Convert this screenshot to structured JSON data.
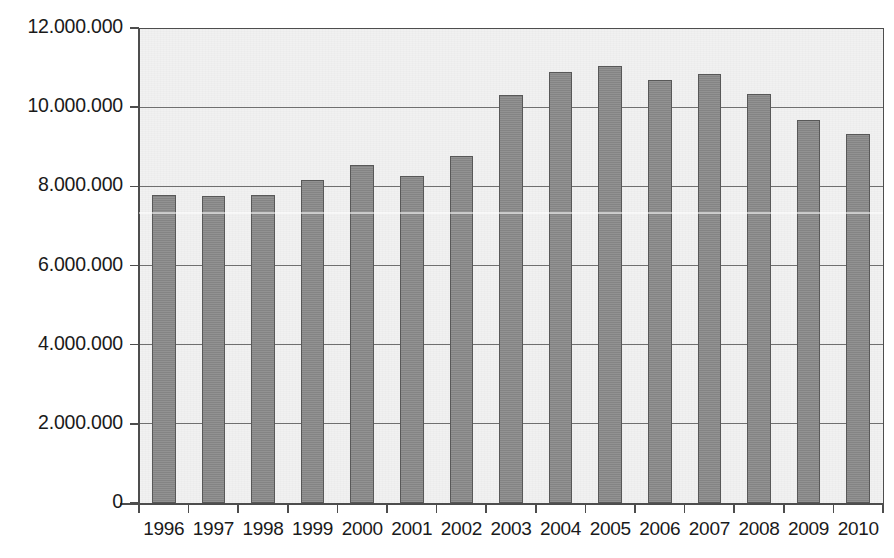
{
  "chart_data": {
    "type": "bar",
    "title": "",
    "subtitle": "",
    "xlabel": "",
    "ylabel": "",
    "categories": [
      "1996",
      "1997",
      "1998",
      "1999",
      "2000",
      "2001",
      "2002",
      "2003",
      "2004",
      "2005",
      "2006",
      "2007",
      "2008",
      "2009",
      "2010"
    ],
    "values": [
      7780000,
      7750000,
      7780000,
      8150000,
      8530000,
      8270000,
      8770000,
      10320000,
      10900000,
      11030000,
      10680000,
      10830000,
      10340000,
      9680000,
      9320000
    ],
    "ylim": [
      0,
      12000000
    ],
    "ytick_values": [
      0,
      2000000,
      4000000,
      6000000,
      8000000,
      10000000,
      12000000
    ],
    "ytick_labels": [
      "0",
      "2.000.000",
      "4.000.000",
      "6.000.000",
      "8.000.000",
      "10.000.000",
      "12.000.000"
    ],
    "grid": true,
    "grid_axis": "y",
    "legend": false,
    "legend_position": "none",
    "bar_color": "#8b8b8b",
    "bar_border_color": "#585858",
    "plot_background": "#f1f1f1",
    "axis_color": "#4d4d4d",
    "gridline_color": "#6f6f6f",
    "text_color": "#1a1a1a",
    "series": [
      {
        "name": "",
        "values": [
          7780000,
          7750000,
          7780000,
          8150000,
          8530000,
          8270000,
          8770000,
          10320000,
          10900000,
          11030000,
          10680000,
          10830000,
          10340000,
          9680000,
          9320000
        ]
      }
    ],
    "annotations": []
  }
}
